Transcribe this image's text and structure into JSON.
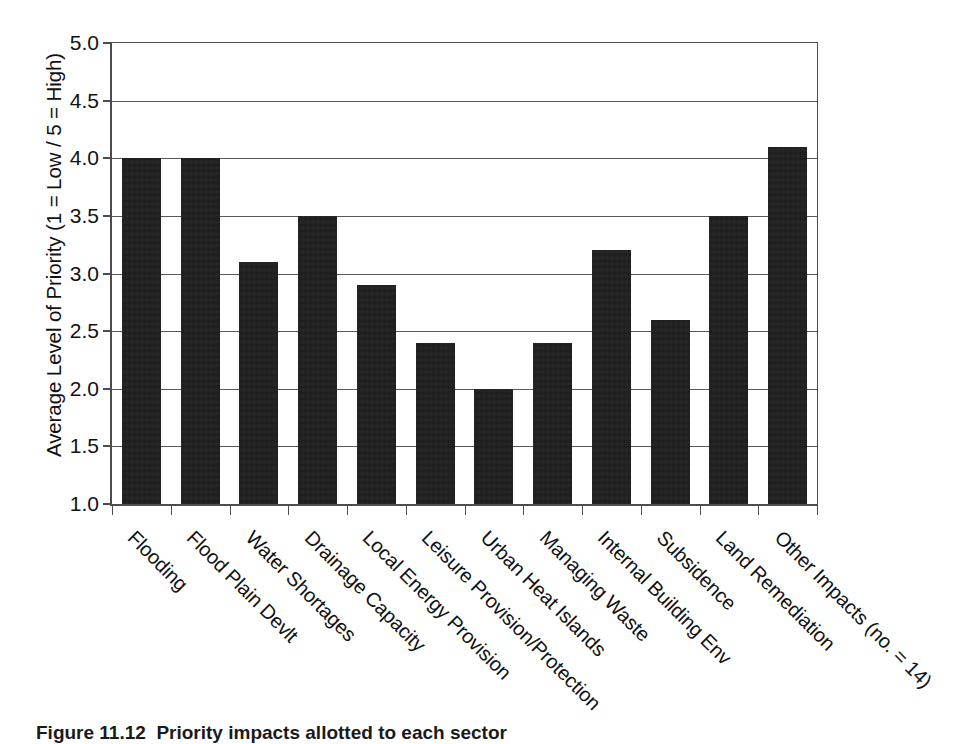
{
  "chart_data": {
    "type": "bar",
    "title": "",
    "xlabel": "",
    "ylabel": "Average Level of Priority (1 = Low / 5 = High)",
    "ylim": [
      1.0,
      5.0
    ],
    "ytick_labels": [
      "5.0",
      "4.5",
      "4.0",
      "3.5",
      "3.0",
      "2.5",
      "2.0",
      "1.5",
      "1.0"
    ],
    "ytick_values": [
      5.0,
      4.5,
      4.0,
      3.5,
      3.0,
      2.5,
      2.0,
      1.5,
      1.0
    ],
    "grid": "horizontal",
    "legend": "none",
    "bar_color": "#1c1c1c",
    "categories": [
      "Flooding",
      "Flood Plain Devlt",
      "Water Shortages",
      "Drainage Capacity",
      "Local Energy Provision",
      "Leisure Provision/Protection",
      "Urban Heat Islands",
      "Managing Waste",
      "Internal Building Env",
      "Subsidence",
      "Land Remediation",
      "Other Impacts (no. = 14)"
    ],
    "values": [
      4.0,
      4.0,
      3.1,
      3.5,
      2.9,
      2.4,
      2.0,
      2.4,
      3.2,
      2.6,
      3.5,
      4.1
    ]
  },
  "caption": {
    "number": "Figure 11.12",
    "text": "Priority impacts allotted to each sector"
  }
}
